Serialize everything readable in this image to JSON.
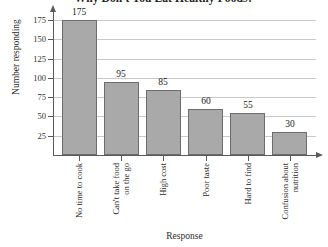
{
  "chart_data": {
    "type": "bar",
    "title": "Why Don't You Eat Healthy Foods?",
    "xlabel": "Response",
    "ylabel": "Number responding",
    "categories": [
      "No time to cook",
      "Can't take food on the go",
      "High cost",
      "Poor taste",
      "Hard to find",
      "Confusion about nutrition"
    ],
    "category_lines": [
      [
        "No time to cook"
      ],
      [
        "Can't take food",
        "on the go"
      ],
      [
        "High cost"
      ],
      [
        "Poor taste"
      ],
      [
        "Hard to find"
      ],
      [
        "Confusion about",
        "nutrition"
      ]
    ],
    "values": [
      175,
      95,
      85,
      60,
      55,
      30
    ],
    "value_labels": [
      "175",
      "95",
      "85",
      "60",
      "55",
      "30"
    ],
    "yticks": [
      25,
      50,
      75,
      100,
      125,
      150,
      175
    ],
    "ytick_labels": [
      "25",
      "50",
      "75",
      "100",
      "125",
      "150",
      "175"
    ],
    "ylim": [
      0,
      187
    ],
    "grid": "horizontal",
    "legend": "none",
    "bar_color": "#a9a9a9",
    "bar_edge_color": "#6d6d6d",
    "axis_color": "#5a5a5a",
    "gridline_color": "#c9c9c9"
  }
}
